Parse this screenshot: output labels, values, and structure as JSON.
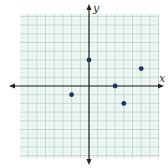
{
  "chart_data": {
    "type": "scatter",
    "title": "",
    "xlabel": "x",
    "ylabel": "y",
    "xlim": [
      -8,
      8
    ],
    "ylim": [
      -8,
      8
    ],
    "grid": true,
    "legend": null,
    "points": [
      {
        "x": 0,
        "y": 3
      },
      {
        "x": -2,
        "y": -1
      },
      {
        "x": 3,
        "y": 0
      },
      {
        "x": 4,
        "y": -2
      },
      {
        "x": 6,
        "y": 2
      }
    ]
  },
  "style": {
    "grid_bg": "#eef7f3",
    "grid_minor": "#c9ddd6",
    "grid_major": "#aac4bb",
    "axis_color": "#222222",
    "point_color": "#1c3564"
  },
  "labels": {
    "x_axis": "x",
    "y_axis": "y"
  }
}
